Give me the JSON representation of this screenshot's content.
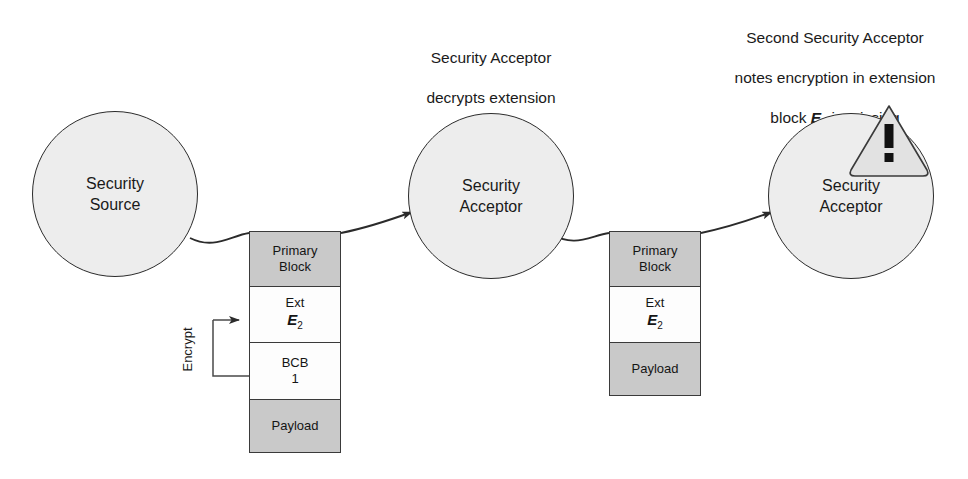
{
  "figure": {
    "type": "diagram",
    "title_text": "",
    "background": "#ffffff"
  },
  "colors": {
    "circle_fill": "#ededed",
    "circle_stroke": "#2b2b2b",
    "block_gray_fill": "#c9c9c9",
    "block_white_fill": "#fdfdfd",
    "block_stroke": "#3a3a3a",
    "line": "#2b2b2b",
    "warning_fill": "#e2e2e2",
    "warning_stroke": "#3a3a3a",
    "text": "#1a1a1a"
  },
  "captions": {
    "middle": {
      "line1": "Security Acceptor",
      "line2": "decrypts extension",
      "line3_prefix": "block ",
      "line3_symbol": "E",
      "line3_subscript": "2",
      "line3_suffix": ""
    },
    "right": {
      "line1": "Second Security Acceptor",
      "line2": "notes encryption in extension",
      "line3_prefix": "block ",
      "line3_symbol": "E",
      "line3_subscript": "2",
      "line3_suffix": " is missing"
    }
  },
  "nodes": [
    {
      "id": "security-source",
      "label_line1": "Security",
      "label_line2": "Source"
    },
    {
      "id": "security-acceptor-1",
      "label_line1": "Security",
      "label_line2": "Acceptor"
    },
    {
      "id": "security-acceptor-2",
      "label_line1": "Security",
      "label_line2": "Acceptor"
    }
  ],
  "bundles": [
    {
      "id": "bundle-1",
      "blocks": [
        {
          "id": "primary-block",
          "line1": "Primary",
          "line2": "Block",
          "fill": "gray",
          "height": 56
        },
        {
          "id": "ext-e2-block",
          "line1": "Ext",
          "symbol": "E",
          "subscript": "2",
          "fill": "white",
          "height": 58
        },
        {
          "id": "bcb-1-block",
          "line1": "BCB",
          "line2": "1",
          "fill": "white",
          "height": 58
        },
        {
          "id": "payload-block",
          "line1": "Payload",
          "fill": "gray",
          "height": 54
        }
      ]
    },
    {
      "id": "bundle-2",
      "blocks": [
        {
          "id": "primary-block",
          "line1": "Primary",
          "line2": "Block",
          "fill": "gray",
          "height": 56
        },
        {
          "id": "ext-e2-block",
          "line1": "Ext",
          "symbol": "E",
          "subscript": "2",
          "fill": "white",
          "height": 58
        },
        {
          "id": "payload-block",
          "line1": "Payload",
          "fill": "gray",
          "height": 54
        }
      ]
    }
  ],
  "annotations": {
    "encrypt_label": "Encrypt",
    "warning_glyph": "!"
  }
}
